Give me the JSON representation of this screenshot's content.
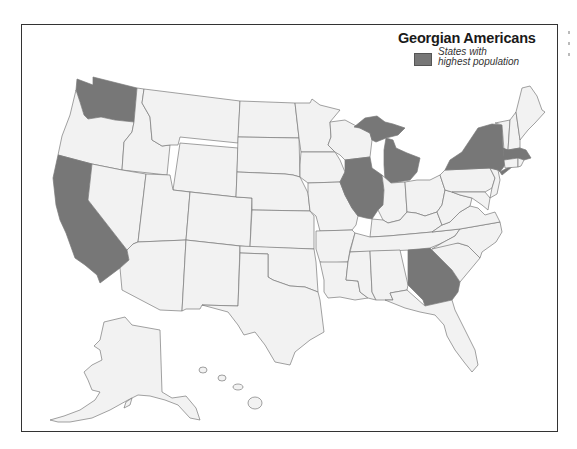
{
  "legend": {
    "title": "Georgian Americans",
    "label_line1": "States with",
    "label_line2": "highest population",
    "swatch_color": "#777777"
  },
  "map": {
    "base_fill": "#f2f2f2",
    "highlight_fill": "#777777",
    "border_color": "#7a7a7a",
    "highlighted_states": [
      "Washington",
      "California",
      "Illinois",
      "Michigan",
      "New York",
      "Massachusetts",
      "Georgia"
    ]
  }
}
